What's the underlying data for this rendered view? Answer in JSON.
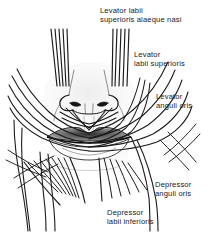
{
  "figure": {
    "width": 219,
    "height": 233,
    "background_color": "#ffffff",
    "ink_color": "#1a1a1a",
    "style": "black and white anatomical line drawing"
  },
  "labels": {
    "levator_labii_superioris_alaeque_nasi": "Levator labii\nsuperioris alaeque nasi",
    "levator_labii_superioris": "Levator\nlabii superioris",
    "levator_anguli_oris": "Levator\nanguli oris",
    "depressor_anguli_oris": "Depressor\nanguli oris",
    "depressor_labii_inferioris": "Depressor\nlabii inferioris"
  },
  "structures": {
    "nose": "nose with two nostrils and alar creases",
    "upper_lip": "shaded upper lip with philtrum",
    "lower_lip": "shaded lower lip",
    "modiolus_left": "left angle of mouth fibre convergence",
    "modiolus_right": "right angle of mouth fibre convergence",
    "orbicularis_oris": "encircling lip muscle fibres"
  }
}
